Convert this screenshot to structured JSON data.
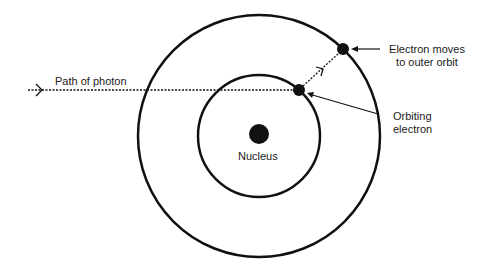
{
  "diagram": {
    "labels": {
      "photon_path": "Path of photon",
      "electron_moves_line1": "Electron moves",
      "electron_moves_line2": "to outer orbit",
      "orbiting_line1": "Orbiting",
      "orbiting_line2": "electron",
      "nucleus": "Nucleus"
    },
    "geometry": {
      "center": [
        259,
        136
      ],
      "outer_orbit_radius": 121,
      "inner_orbit_radius": 61,
      "nucleus_radius": 10,
      "inner_electron": [
        299,
        90
      ],
      "outer_electron": [
        343,
        50
      ],
      "electron_radius": 6
    },
    "colors": {
      "stroke": "#111111",
      "background": "#ffffff"
    }
  }
}
